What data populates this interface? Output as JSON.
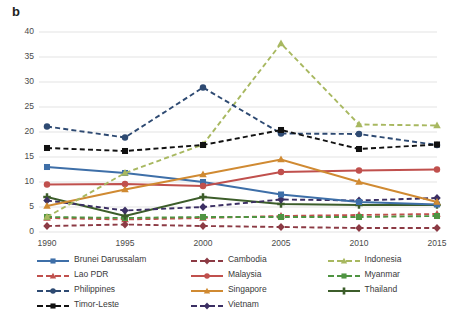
{
  "panel_label": "b",
  "chart_data": {
    "type": "line",
    "title": "",
    "xlabel": "",
    "ylabel": "",
    "categories": [
      "1990",
      "1995",
      "2000",
      "2005",
      "2010",
      "2015"
    ],
    "x_tick_labels": [
      "1990",
      "1995",
      "2000",
      "2005",
      "2010",
      "2015"
    ],
    "y_tick_labels": [
      "0",
      "5",
      "10",
      "15",
      "20",
      "25",
      "30",
      "35",
      "40"
    ],
    "ylim": [
      0,
      40
    ],
    "y_tick_step": 5,
    "grid": "horizontal",
    "legend_position": "bottom",
    "legend_columns": 3,
    "series": [
      {
        "name": "Brunei Darussalam",
        "color": "#3e6fa8",
        "dash": "solid",
        "marker": "square",
        "values": [
          13.0,
          11.8,
          10.0,
          7.5,
          6.0,
          5.5
        ]
      },
      {
        "name": "Cambodia",
        "color": "#8c3a44",
        "dash": "dashed",
        "marker": "diamond",
        "values": [
          1.2,
          1.5,
          1.2,
          1.0,
          0.8,
          0.8
        ]
      },
      {
        "name": "Indonesia",
        "color": "#a8b860",
        "dash": "dashed",
        "marker": "triangle",
        "values": [
          3.0,
          11.8,
          17.5,
          37.7,
          21.5,
          21.3
        ]
      },
      {
        "name": "Lao PDR",
        "color": "#c0504d",
        "dash": "dashed",
        "marker": "triangle",
        "values": [
          2.8,
          2.5,
          2.8,
          3.2,
          3.4,
          3.6
        ]
      },
      {
        "name": "Malaysia",
        "color": "#c0504d",
        "dash": "solid",
        "marker": "circle",
        "values": [
          9.5,
          9.6,
          9.2,
          12.0,
          12.3,
          12.5
        ]
      },
      {
        "name": "Myanmar",
        "color": "#4f9442",
        "dash": "dashed",
        "marker": "square",
        "values": [
          3.0,
          2.8,
          3.0,
          3.0,
          3.0,
          3.2
        ]
      },
      {
        "name": "Philippines",
        "color": "#2e4a72",
        "dash": "dashed",
        "marker": "circle",
        "values": [
          21.1,
          18.9,
          28.9,
          19.7,
          19.6,
          17.4
        ]
      },
      {
        "name": "Singapore",
        "color": "#d08a32",
        "dash": "solid",
        "marker": "triangle",
        "values": [
          5.2,
          8.5,
          11.5,
          14.5,
          10.0,
          6.0
        ]
      },
      {
        "name": "Thailand",
        "color": "#3c5d2a",
        "dash": "solid",
        "marker": "plus",
        "values": [
          7.0,
          3.2,
          7.0,
          5.6,
          5.4,
          5.4
        ]
      },
      {
        "name": "Timor-Leste",
        "color": "#111111",
        "dash": "dashed",
        "marker": "square",
        "values": [
          16.8,
          16.2,
          17.4,
          20.4,
          16.6,
          17.5
        ]
      },
      {
        "name": "Vietnam",
        "color": "#3b2f63",
        "dash": "dashed",
        "marker": "diamond",
        "values": [
          6.3,
          4.3,
          5.0,
          6.5,
          6.3,
          6.8
        ]
      }
    ]
  }
}
